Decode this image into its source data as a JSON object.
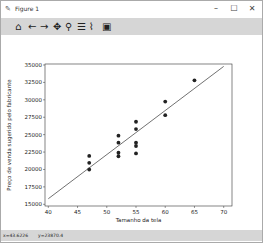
{
  "window": {
    "title": "Figure 1",
    "title_icon": "✎",
    "minimize": "–",
    "maximize": "☐",
    "close": "✕"
  },
  "toolbar": {
    "home": "⌂",
    "back": "←",
    "forward": "→",
    "pan": "✥",
    "zoom": "⚲",
    "configure": "☰",
    "edit": "⌇",
    "save": "▣"
  },
  "status": {
    "x": "x=43.6226",
    "y": "y=23870.4"
  },
  "chart_data": {
    "type": "scatter",
    "title": "",
    "xlabel": "Tamanho da tela",
    "ylabel": "Preço de venda sugerido pelo fabricante",
    "xlim": [
      39.5,
      70.5
    ],
    "ylim": [
      15000,
      35500
    ],
    "xticks": [
      40,
      45,
      50,
      55,
      60,
      65,
      70
    ],
    "yticks": [
      15000,
      17500,
      20000,
      22500,
      25000,
      27500,
      30000,
      32500,
      35000
    ],
    "grid": false,
    "series": [
      {
        "name": "dados",
        "type": "scatter",
        "points": [
          [
            47,
            20000
          ],
          [
            47,
            20950
          ],
          [
            47,
            21950
          ],
          [
            52,
            21900
          ],
          [
            52,
            22400
          ],
          [
            52,
            23850
          ],
          [
            52,
            24850
          ],
          [
            55,
            22300
          ],
          [
            55,
            23370
          ],
          [
            55,
            23850
          ],
          [
            55,
            25800
          ],
          [
            55,
            26850
          ],
          [
            60,
            27800
          ],
          [
            60,
            29750
          ],
          [
            65,
            32800
          ]
        ]
      },
      {
        "name": "regressão",
        "type": "line",
        "points": [
          [
            40,
            15800
          ],
          [
            70,
            34800
          ]
        ]
      }
    ]
  }
}
